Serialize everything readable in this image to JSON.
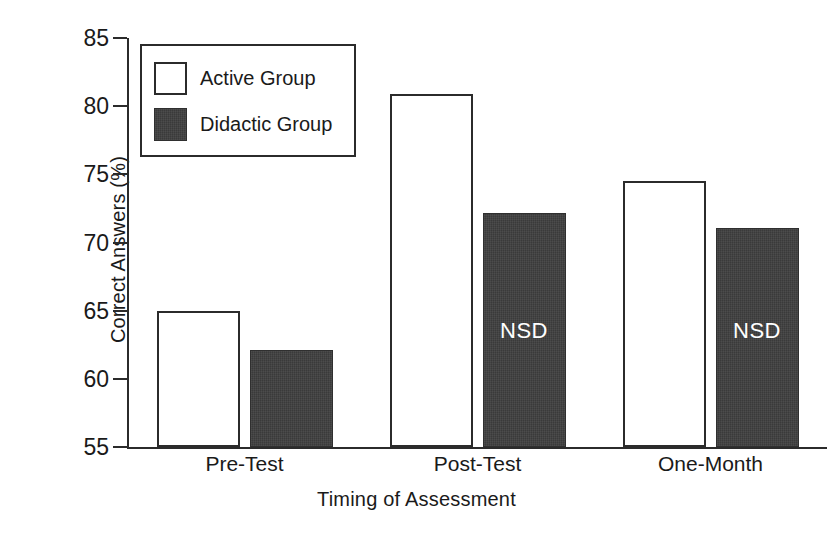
{
  "chart_data": {
    "type": "bar",
    "title": "",
    "xlabel": "Timing of Assessment",
    "ylabel": "Correct Answers (%)",
    "categories": [
      "Pre-Test",
      "Post-Test",
      "One-Month"
    ],
    "series": [
      {
        "name": "Active Group",
        "color": "#ffffff",
        "values": [
          65.0,
          80.9,
          74.5
        ]
      },
      {
        "name": "Didactic Group",
        "color": "#3a3a3a",
        "values": [
          62.1,
          72.2,
          71.1
        ]
      }
    ],
    "ylim": [
      55,
      85
    ],
    "yticks": [
      55,
      60,
      65,
      70,
      75,
      80,
      85
    ],
    "ytick_labels": [
      "55",
      "60",
      "65",
      "70",
      "75",
      "80",
      "85"
    ],
    "grid": false,
    "legend_position": "top-left",
    "annotations": [
      {
        "text": "NSD",
        "series": "Didactic Group",
        "category": "Pre-Test"
      },
      {
        "text": "NSD",
        "series": "Didactic Group",
        "category": "Post-Test"
      },
      {
        "text": "NSD",
        "series": "Didactic Group",
        "category": "One-Month"
      }
    ]
  },
  "legend": {
    "entries": [
      {
        "label": "Active Group",
        "swatch": "open-square-swatch"
      },
      {
        "label": "Didactic Group",
        "swatch": "filled-square-swatch"
      }
    ]
  }
}
